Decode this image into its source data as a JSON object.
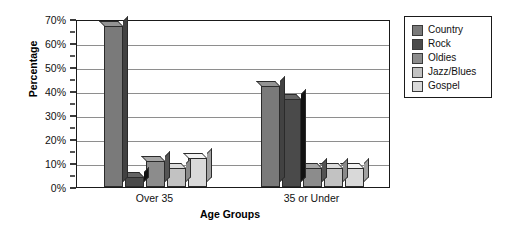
{
  "chart_data": {
    "type": "bar",
    "title": "",
    "xlabel": "Age Groups",
    "ylabel": "Percentage",
    "categories": [
      "Over 35",
      "35 or Under"
    ],
    "series": [
      {
        "name": "Country",
        "color": "#7a7a7a",
        "values": [
          67,
          42
        ]
      },
      {
        "name": "Rock",
        "color": "#4a4a4a",
        "values": [
          4,
          36.5
        ]
      },
      {
        "name": "Oldies",
        "color": "#8c8c8c",
        "values": [
          11,
          8
        ]
      },
      {
        "name": "Jazz/Blues",
        "color": "#c2c2c2",
        "values": [
          8,
          8
        ]
      },
      {
        "name": "Gospel",
        "color": "#d9d9d9",
        "values": [
          12,
          8
        ]
      }
    ],
    "ylim": [
      0,
      70
    ],
    "y_ticks": [
      "0%",
      "10%",
      "20%",
      "30%",
      "40%",
      "50%",
      "60%",
      "70%"
    ],
    "y_tick_values": [
      0,
      10,
      20,
      30,
      40,
      50,
      60,
      70
    ],
    "y_minor_tick_values": [
      5,
      15,
      25,
      35,
      45,
      55,
      65
    ],
    "grid": true,
    "legend_position": "right",
    "legend_entries": [
      "Country",
      "Rock",
      "Oldies",
      "Jazz/Blues",
      "Gospel"
    ]
  },
  "axes": {
    "y_title": "Percentage",
    "x_title": "Age Groups"
  }
}
